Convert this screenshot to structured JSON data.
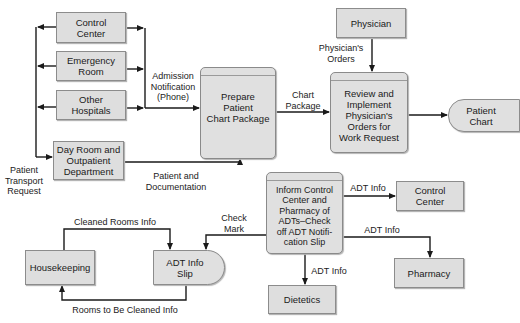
{
  "diagram": {
    "type": "data-flow-diagram",
    "external_entities": {
      "control_center_left": "Control\nCenter",
      "emergency_room": "Emergency\nRoom",
      "other_hospitals": "Other\nHospitals",
      "day_room": "Day Room and\nOutpatient\nDepartment",
      "physician": "Physician",
      "control_center_right": "Control\nCenter",
      "pharmacy": "Pharmacy",
      "dietetics": "Dietetics",
      "housekeeping": "Housekeeping"
    },
    "processes": {
      "prepare_chart": "Prepare\nPatient\nChart Package",
      "review_orders": "Review and\nImplement\nPhysician's\nOrders for\nWork Request",
      "inform_control": "Inform Control\nCenter and\nPharmacy of\nADTs–Check\noff ADT Notifi-\ncation Slip"
    },
    "data_stores": {
      "patient_chart": "Patient\nChart",
      "adt_info_slip": "ADT Info\nSlip"
    },
    "flow_labels": {
      "patient_transport_request": "Patient\nTransport\nRequest",
      "admission_notification": "Admission\nNotification\n(Phone)",
      "patient_and_documentation": "Patient and\nDocumentation",
      "chart_package": "Chart\nPackage",
      "physicians_orders": "Physician's\nOrders",
      "adt_info_control": "ADT Info",
      "adt_info_pharmacy": "ADT Info",
      "adt_info_dietetics": "ADT Info",
      "check_mark": "Check\nMark",
      "cleaned_rooms_info": "Cleaned Rooms Info",
      "rooms_to_be_cleaned_info": "Rooms to Be Cleaned Info"
    },
    "colors": {
      "box_fill": "#dedede",
      "box_border": "#8c8c8c",
      "line": "#1a1a1a"
    }
  }
}
